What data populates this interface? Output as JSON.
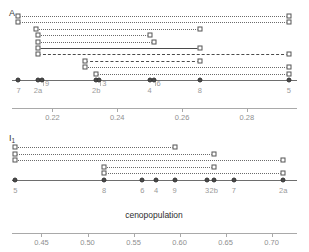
{
  "figure": {
    "width": 309,
    "height": 252,
    "background": "#ffffff",
    "line_color": "#6a6a6a",
    "label_color": "#9a9a9a",
    "axis_title_color": "#2e2e2e"
  },
  "axis_title": "cenopopulation",
  "chart_data": {
    "type": "scatter",
    "title": "",
    "xlabel": "cenopopulation",
    "ylabel": "",
    "panels": [
      {
        "id": "A",
        "label": "A",
        "xlim": [
          0.2075,
          0.2955
        ],
        "ticks": [
          0.22,
          0.24,
          0.26,
          0.28
        ],
        "tick_labels": [
          "0.22",
          "0.24",
          "0.26",
          "0.28"
        ],
        "grid": false,
        "groups": [
          {
            "label": "7",
            "value": 0.2095
          },
          {
            "label": "2a",
            "value": 0.2155
          },
          {
            "label": "9",
            "value": 0.2168
          },
          {
            "label": "2b",
            "value": 0.2335
          },
          {
            "label": "3",
            "value": 0.2345
          },
          {
            "label": "4",
            "value": 0.25
          },
          {
            "label": "6",
            "value": 0.2512
          },
          {
            "label": "8",
            "value": 0.2655
          },
          {
            "label": "5",
            "value": 0.293
          }
        ],
        "links": [
          {
            "style": "dotted",
            "from": 0.2335,
            "to": 0.293,
            "level": 1
          },
          {
            "style": "dotted",
            "from": 0.23,
            "to": 0.293,
            "level": 2
          },
          {
            "style": "dashed",
            "from": 0.23,
            "to": 0.2655,
            "level": 3
          },
          {
            "style": "dashed",
            "from": 0.2155,
            "to": 0.293,
            "level": 4
          },
          {
            "style": "solid",
            "from": 0.2155,
            "to": 0.2655,
            "level": 5
          },
          {
            "style": "dotted",
            "from": 0.2155,
            "to": 0.2512,
            "level": 6
          },
          {
            "style": "dotted",
            "from": 0.2155,
            "to": 0.25,
            "level": 7
          },
          {
            "style": "dotted",
            "from": 0.2148,
            "to": 0.2655,
            "level": 8
          },
          {
            "style": "dotted",
            "from": 0.2095,
            "to": 0.293,
            "level": 9
          },
          {
            "style": "dotted",
            "from": 0.2095,
            "to": 0.293,
            "level": 10
          }
        ]
      },
      {
        "id": "I1",
        "label": "I",
        "label_sub": "1",
        "xlim": [
          0.418,
          0.7275
        ],
        "ticks": [
          0.45,
          0.5,
          0.55,
          0.6,
          0.65,
          0.7
        ],
        "tick_labels": [
          "0.45",
          "0.50",
          "0.55",
          "0.60",
          "0.65",
          "0.70"
        ],
        "grid": false,
        "groups": [
          {
            "label": "5",
            "value": 0.4215
          },
          {
            "label": "8",
            "value": 0.518
          },
          {
            "label": "6",
            "value": 0.5595
          },
          {
            "label": "4",
            "value": 0.5745
          },
          {
            "label": "9",
            "value": 0.5945
          },
          {
            "label": "3",
            "value": 0.63
          },
          {
            "label": "2b",
            "value": 0.637
          },
          {
            "label": "7",
            "value": 0.659
          },
          {
            "label": "2a",
            "value": 0.7125
          }
        ],
        "links": [
          {
            "style": "dotted",
            "from": 0.518,
            "to": 0.7125,
            "level": 1
          },
          {
            "style": "dotted",
            "from": 0.518,
            "to": 0.637,
            "level": 2
          },
          {
            "style": "dotted",
            "from": 0.4215,
            "to": 0.7125,
            "level": 3
          },
          {
            "style": "dotted",
            "from": 0.4215,
            "to": 0.637,
            "level": 4
          },
          {
            "style": "dotted",
            "from": 0.4215,
            "to": 0.5945,
            "level": 5
          }
        ]
      }
    ]
  }
}
